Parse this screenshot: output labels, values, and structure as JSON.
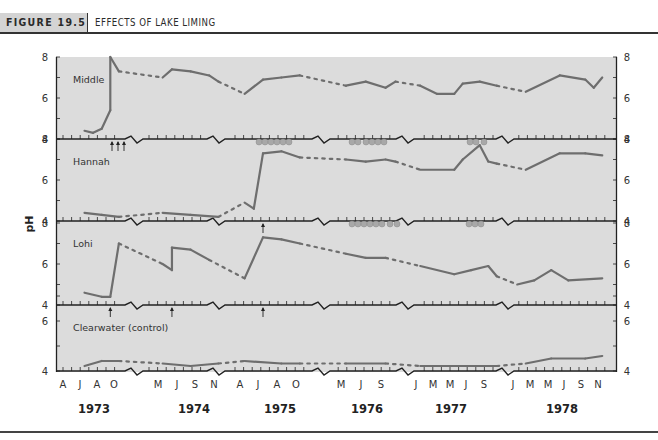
{
  "header": {
    "figure_label": "FIGURE 19.5",
    "title": "EFFECTS OF LAKE LIMING"
  },
  "chart_data": {
    "type": "line",
    "title": "Effects of Lake Liming",
    "xlabel": "",
    "ylabel": "pH",
    "ylim": [
      4,
      8
    ],
    "y_ticks": [
      4,
      6,
      8
    ],
    "grid": false,
    "legend": "none (panel labels inside each subplot)",
    "x_years": [
      "1973",
      "1974",
      "1975",
      "1976",
      "1977",
      "1978"
    ],
    "x_month_ticks": [
      "A",
      "J",
      "A",
      "O",
      "M",
      "J",
      "S",
      "N",
      "A",
      "J",
      "A",
      "O",
      "M",
      "J",
      "S",
      "J",
      "M",
      "M",
      "J",
      "S",
      "J",
      "M",
      "M",
      "J",
      "S",
      "N"
    ],
    "annotations": [
      "Arrows beneath axis mark liming treatments",
      "Grey circles beneath axis mark ice-cover periods",
      "Dotted segments indicate interpolated periods (winter gaps)"
    ],
    "series": [
      {
        "name": "Middle",
        "liming_events": [
          "1973-Sep",
          "1973-Sep",
          "1973-Oct"
        ],
        "points": [
          {
            "x": "1973-Jun",
            "y": 4.4
          },
          {
            "x": "1973-Jul",
            "y": 4.3
          },
          {
            "x": "1973-Aug",
            "y": 4.5
          },
          {
            "x": "1973-Sep",
            "y": 5.4
          },
          {
            "x": "1973-Sep",
            "y": 8.0
          },
          {
            "x": "1973-Oct",
            "y": 7.3
          },
          {
            "x": "1974-May",
            "y": 7.0
          },
          {
            "x": "1974-Jun",
            "y": 7.4
          },
          {
            "x": "1974-Aug",
            "y": 7.3
          },
          {
            "x": "1974-Oct",
            "y": 7.1
          },
          {
            "x": "1974-Nov",
            "y": 6.8
          },
          {
            "x": "1975-Apr",
            "y": 6.2
          },
          {
            "x": "1975-Jun",
            "y": 6.9
          },
          {
            "x": "1975-Aug",
            "y": 7.0
          },
          {
            "x": "1975-Oct",
            "y": 7.1
          },
          {
            "x": "1976-May",
            "y": 6.6
          },
          {
            "x": "1976-Jul",
            "y": 6.8
          },
          {
            "x": "1976-Sep",
            "y": 6.5
          },
          {
            "x": "1976-Oct",
            "y": 6.8
          },
          {
            "x": "1977-Jan",
            "y": 6.6
          },
          {
            "x": "1977-Mar",
            "y": 6.2
          },
          {
            "x": "1977-May",
            "y": 6.2
          },
          {
            "x": "1977-Jun",
            "y": 6.7
          },
          {
            "x": "1977-Aug",
            "y": 6.8
          },
          {
            "x": "1977-Oct",
            "y": 6.6
          },
          {
            "x": "1978-Feb",
            "y": 6.3
          },
          {
            "x": "1978-Jun",
            "y": 7.1
          },
          {
            "x": "1978-Sep",
            "y": 6.9
          },
          {
            "x": "1978-Oct",
            "y": 6.5
          },
          {
            "x": "1978-Nov",
            "y": 7.0
          }
        ]
      },
      {
        "name": "Hannah",
        "liming_events": [
          "1975-Jun"
        ],
        "points": [
          {
            "x": "1973-Jun",
            "y": 4.4
          },
          {
            "x": "1973-Aug",
            "y": 4.3
          },
          {
            "x": "1973-Oct",
            "y": 4.2
          },
          {
            "x": "1974-May",
            "y": 4.4
          },
          {
            "x": "1974-Aug",
            "y": 4.3
          },
          {
            "x": "1974-Nov",
            "y": 4.2
          },
          {
            "x": "1975-Apr",
            "y": 4.9
          },
          {
            "x": "1975-May",
            "y": 4.6
          },
          {
            "x": "1975-Jun",
            "y": 7.3
          },
          {
            "x": "1975-Aug",
            "y": 7.4
          },
          {
            "x": "1975-Oct",
            "y": 7.1
          },
          {
            "x": "1976-May",
            "y": 7.0
          },
          {
            "x": "1976-Jul",
            "y": 6.9
          },
          {
            "x": "1976-Sep",
            "y": 7.0
          },
          {
            "x": "1976-Oct",
            "y": 6.9
          },
          {
            "x": "1977-Jan",
            "y": 6.5
          },
          {
            "x": "1977-May",
            "y": 6.5
          },
          {
            "x": "1977-Jun",
            "y": 7.0
          },
          {
            "x": "1977-Aug",
            "y": 7.7
          },
          {
            "x": "1977-Sep",
            "y": 6.9
          },
          {
            "x": "1977-Oct",
            "y": 6.8
          },
          {
            "x": "1978-Feb",
            "y": 6.5
          },
          {
            "x": "1978-Jun",
            "y": 7.3
          },
          {
            "x": "1978-Sep",
            "y": 7.3
          },
          {
            "x": "1978-Nov",
            "y": 7.2
          }
        ]
      },
      {
        "name": "Lohi",
        "liming_events": [
          "1973-Sep",
          "1974-Jun",
          "1975-Jun"
        ],
        "points": [
          {
            "x": "1973-Jun",
            "y": 4.6
          },
          {
            "x": "1973-Aug",
            "y": 4.4
          },
          {
            "x": "1973-Sep",
            "y": 4.4
          },
          {
            "x": "1973-Oct",
            "y": 7.0
          },
          {
            "x": "1974-May",
            "y": 6.0
          },
          {
            "x": "1974-Jun",
            "y": 5.7
          },
          {
            "x": "1974-Jun",
            "y": 6.8
          },
          {
            "x": "1974-Aug",
            "y": 6.7
          },
          {
            "x": "1974-Oct",
            "y": 6.2
          },
          {
            "x": "1975-Apr",
            "y": 5.3
          },
          {
            "x": "1975-Jun",
            "y": 7.3
          },
          {
            "x": "1975-Aug",
            "y": 7.2
          },
          {
            "x": "1975-Oct",
            "y": 7.0
          },
          {
            "x": "1976-May",
            "y": 6.5
          },
          {
            "x": "1976-Jul",
            "y": 6.3
          },
          {
            "x": "1976-Sep",
            "y": 6.3
          },
          {
            "x": "1977-Jan",
            "y": 5.9
          },
          {
            "x": "1977-May",
            "y": 5.5
          },
          {
            "x": "1977-Jul",
            "y": 5.7
          },
          {
            "x": "1977-Sep",
            "y": 5.9
          },
          {
            "x": "1977-Oct",
            "y": 5.4
          },
          {
            "x": "1978-Jan",
            "y": 5.0
          },
          {
            "x": "1978-Mar",
            "y": 5.2
          },
          {
            "x": "1978-May",
            "y": 5.7
          },
          {
            "x": "1978-Jul",
            "y": 5.2
          },
          {
            "x": "1978-Nov",
            "y": 5.3
          }
        ]
      },
      {
        "name": "Clearwater (control)",
        "liming_events": [],
        "points": [
          {
            "x": "1973-Jun",
            "y": 4.2
          },
          {
            "x": "1973-Aug",
            "y": 4.4
          },
          {
            "x": "1973-Oct",
            "y": 4.4
          },
          {
            "x": "1974-May",
            "y": 4.3
          },
          {
            "x": "1974-Aug",
            "y": 4.2
          },
          {
            "x": "1974-Nov",
            "y": 4.3
          },
          {
            "x": "1975-Apr",
            "y": 4.4
          },
          {
            "x": "1975-Aug",
            "y": 4.3
          },
          {
            "x": "1975-Oct",
            "y": 4.3
          },
          {
            "x": "1976-May",
            "y": 4.3
          },
          {
            "x": "1976-Sep",
            "y": 4.3
          },
          {
            "x": "1977-Jan",
            "y": 4.2
          },
          {
            "x": "1977-Jun",
            "y": 4.2
          },
          {
            "x": "1977-Oct",
            "y": 4.2
          },
          {
            "x": "1978-Feb",
            "y": 4.3
          },
          {
            "x": "1978-May",
            "y": 4.5
          },
          {
            "x": "1978-Sep",
            "y": 4.5
          },
          {
            "x": "1978-Nov",
            "y": 4.6
          }
        ]
      }
    ]
  },
  "panels": [
    {
      "label": "Middle"
    },
    {
      "label": "Hannah"
    },
    {
      "label": "Lohi"
    },
    {
      "label": "Clearwater (control)"
    }
  ],
  "axis": {
    "ylabel": "pH",
    "tick_4": "4",
    "tick_6": "6",
    "tick_8": "8",
    "months": [
      {
        "label": "A",
        "x": 63
      },
      {
        "label": "J",
        "x": 80
      },
      {
        "label": "A",
        "x": 97
      },
      {
        "label": "O",
        "x": 114
      },
      {
        "label": "M",
        "x": 158
      },
      {
        "label": "J",
        "x": 177
      },
      {
        "label": "S",
        "x": 195
      },
      {
        "label": "N",
        "x": 214
      },
      {
        "label": "A",
        "x": 240
      },
      {
        "label": "J",
        "x": 258
      },
      {
        "label": "A",
        "x": 277
      },
      {
        "label": "O",
        "x": 296
      },
      {
        "label": "M",
        "x": 341
      },
      {
        "label": "J",
        "x": 361
      },
      {
        "label": "S",
        "x": 381
      },
      {
        "label": "J",
        "x": 416
      },
      {
        "label": "M",
        "x": 433
      },
      {
        "label": "M",
        "x": 450
      },
      {
        "label": "J",
        "x": 466
      },
      {
        "label": "S",
        "x": 484
      },
      {
        "label": "J",
        "x": 513
      },
      {
        "label": "M",
        "x": 530
      },
      {
        "label": "M",
        "x": 548
      },
      {
        "label": "J",
        "x": 564
      },
      {
        "label": "S",
        "x": 581
      },
      {
        "label": "N",
        "x": 598
      }
    ],
    "years": [
      {
        "label": "1973",
        "x": 94
      },
      {
        "label": "1974",
        "x": 194
      },
      {
        "label": "1975",
        "x": 280
      },
      {
        "label": "1976",
        "x": 367
      },
      {
        "label": "1977",
        "x": 451
      },
      {
        "label": "1978",
        "x": 562
      }
    ]
  }
}
